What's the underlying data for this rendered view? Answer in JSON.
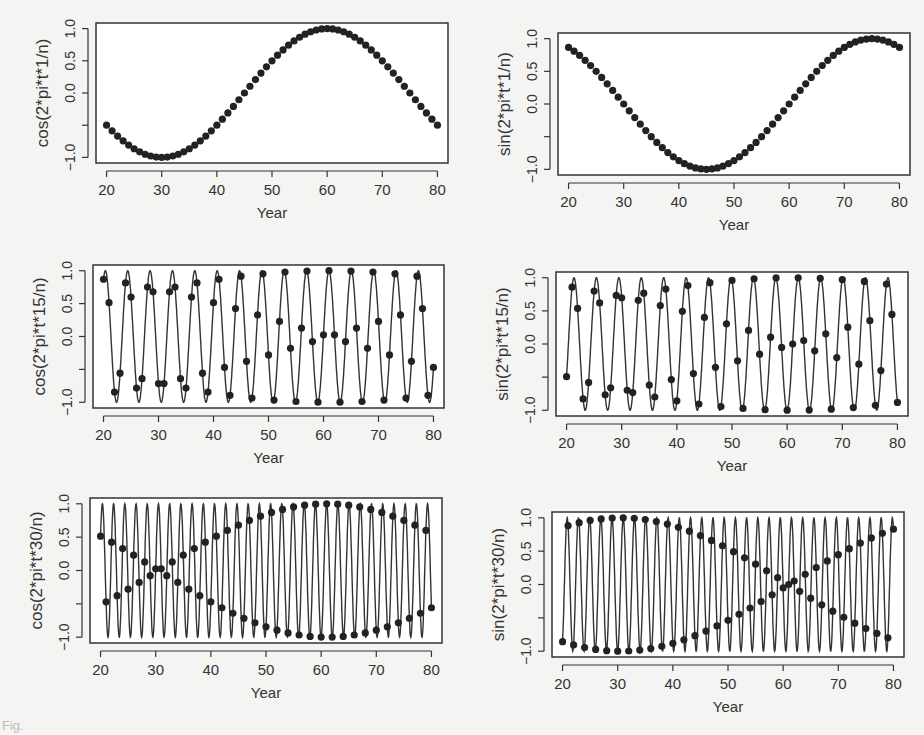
{
  "figure": {
    "caption_fragment": "Fig."
  },
  "chart_data": [
    {
      "type": "line",
      "title": "",
      "xlabel": "Year",
      "ylabel": "cos(2*pi*t*1/n)",
      "freq": 1,
      "fn": "cos",
      "x_ticks": [
        20,
        30,
        40,
        50,
        60,
        70,
        80
      ],
      "y_ticks": [
        -1.0,
        -0.5,
        0.0,
        0.5,
        1.0
      ],
      "y_tick_labels": [
        "-1.0",
        "",
        "0.0",
        "0.5",
        "1.0"
      ],
      "xlim": [
        20,
        80
      ],
      "ylim": [
        -1,
        1
      ],
      "n": 60,
      "points": "t = 20..80 (61 points), y = cos(2*pi*t*1/60)",
      "markers": true,
      "line": false
    },
    {
      "type": "line",
      "title": "",
      "xlabel": "Year",
      "ylabel": "sin(2*pi*t*1/n)",
      "freq": 1,
      "fn": "sin",
      "x_ticks": [
        20,
        30,
        40,
        50,
        60,
        70,
        80
      ],
      "y_ticks": [
        -1.0,
        -0.5,
        0.0,
        0.5,
        1.0
      ],
      "y_tick_labels": [
        "-1.0",
        "",
        "0.0",
        "0.5",
        "1.0"
      ],
      "xlim": [
        20,
        80
      ],
      "ylim": [
        -1,
        1
      ],
      "n": 60,
      "points": "t = 20..80 (61 points), y = sin(2*pi*t*1/60)",
      "markers": true,
      "line": false
    },
    {
      "type": "line",
      "title": "",
      "xlabel": "Year",
      "ylabel": "cos(2*pi*t*15/n)",
      "freq": 15,
      "fn": "cos",
      "x_ticks": [
        20,
        30,
        40,
        50,
        60,
        70,
        80
      ],
      "y_ticks": [
        -1.0,
        -0.5,
        0.0,
        0.5,
        1.0
      ],
      "y_tick_labels": [
        "-1.0",
        "",
        "0.0",
        "0.5",
        "1.0"
      ],
      "xlim": [
        20,
        80
      ],
      "ylim": [
        -1,
        1
      ],
      "n": 61,
      "points": "markers at integer t = 20..80, smooth curve y = cos(2*pi*t*15/61)",
      "markers": true,
      "line": true
    },
    {
      "type": "line",
      "title": "",
      "xlabel": "Year",
      "ylabel": "sin(2*pi*t*15/n)",
      "freq": 15,
      "fn": "sin",
      "x_ticks": [
        20,
        30,
        40,
        50,
        60,
        70,
        80
      ],
      "y_ticks": [
        -1.0,
        -0.5,
        0.0,
        0.5,
        1.0
      ],
      "y_tick_labels": [
        "-1.0",
        "",
        "0.0",
        "0.5",
        "1.0"
      ],
      "xlim": [
        20,
        80
      ],
      "ylim": [
        -1,
        1
      ],
      "n": 61,
      "points": "markers at integer t = 20..80, smooth curve y = sin(2*pi*t*15/61)",
      "markers": true,
      "line": true
    },
    {
      "type": "line",
      "title": "",
      "xlabel": "Year",
      "ylabel": "cos(2*pi*t*30/n)",
      "freq": 30,
      "fn": "cos",
      "x_ticks": [
        20,
        30,
        40,
        50,
        60,
        70,
        80
      ],
      "y_ticks": [
        -1.0,
        -0.5,
        0.0,
        0.5,
        1.0
      ],
      "y_tick_labels": [
        "-1.0",
        "",
        "0.0",
        "0.5",
        "1.0"
      ],
      "xlim": [
        20,
        80
      ],
      "ylim": [
        -1,
        1
      ],
      "n": 61,
      "points": "markers at integer t = 20..80, smooth curve y = cos(2*pi*t*30/61)",
      "markers": true,
      "line": true
    },
    {
      "type": "line",
      "title": "",
      "xlabel": "Year",
      "ylabel": "sin(2*pi*t*30/n)",
      "freq": 30,
      "fn": "sin",
      "x_ticks": [
        20,
        30,
        40,
        50,
        60,
        70,
        80
      ],
      "y_ticks": [
        -1.0,
        -0.5,
        0.0,
        0.5,
        1.0
      ],
      "y_tick_labels": [
        "-1.0",
        "",
        "0.0",
        "0.5",
        "1.0"
      ],
      "xlim": [
        20,
        80
      ],
      "ylim": [
        -1,
        1
      ],
      "n": 61,
      "points": "markers at integer t = 20..80, smooth curve y = sin(2*pi*t*30/61)",
      "markers": true,
      "line": true
    }
  ],
  "layout": {
    "panels": [
      {
        "left": 96,
        "top": 23,
        "width": 352,
        "height": 140
      },
      {
        "left": 558,
        "top": 33,
        "width": 352,
        "height": 142
      },
      {
        "left": 93,
        "top": 265,
        "width": 351,
        "height": 143
      },
      {
        "left": 556,
        "top": 272,
        "width": 352,
        "height": 144
      },
      {
        "left": 90,
        "top": 498,
        "width": 352,
        "height": 145
      },
      {
        "left": 552,
        "top": 512,
        "width": 352,
        "height": 145
      }
    ]
  }
}
